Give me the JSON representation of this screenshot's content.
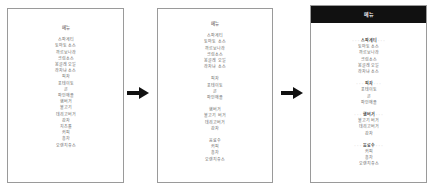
{
  "diagram": {
    "title": "메뉴",
    "panel1": {
      "title": "메뉴",
      "items": [
        "스파게티",
        "토마토 소스",
        "까르보나라",
        "크림소스",
        "봉골레 오일",
        "라자냐 소스",
        "피자",
        "포테이토",
        "콘",
        "파인애플",
        "햄버거",
        "불고기",
        "데리고버거",
        "감자",
        "치즈롤",
        "커피",
        "홍차",
        "오렌지쥬스"
      ]
    },
    "panel2": {
      "title": "메뉴",
      "groups": [
        [
          "스파게티",
          "토마토 소스",
          "까르보나라",
          "크림소스",
          "봉골레 오일",
          "라자냐 소스"
        ],
        [
          "피자",
          "포테이토",
          "콘",
          "파인애플"
        ],
        [
          "햄버거",
          "불고기 버거",
          "데리고버거",
          "감자"
        ],
        [
          "음료수",
          "커피",
          "홍차",
          "오렌지쥬스"
        ]
      ]
    },
    "panel3": {
      "title": "메뉴",
      "groups": [
        {
          "header": "스파게티",
          "items": [
            "토마토 소스",
            "까르보나라",
            "크림소스",
            "봉골레 오일",
            "라자냐 소스"
          ]
        },
        {
          "header": "피자",
          "items": [
            "포테이토",
            "콘",
            "파인애플"
          ]
        },
        {
          "header": "햄버거",
          "items": [
            "불고기 버거",
            "데리고버거",
            "감자"
          ]
        },
        {
          "header": "음료수",
          "items": [
            "커피",
            "홍차",
            "오렌지쥬스"
          ]
        }
      ]
    },
    "arrows": [
      "arrow-1-to-2",
      "arrow-2-to-3"
    ]
  }
}
